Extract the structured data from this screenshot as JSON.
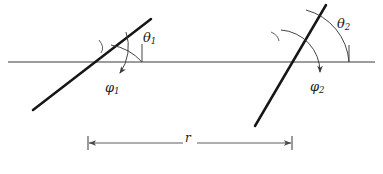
{
  "figure": {
    "background_color": "#ffffff",
    "line_color": "#1a1a1a",
    "baseline_color": "#3a3a3a",
    "arc_color": "#4a4a4a",
    "dimension_color": "#4a4a4a",
    "labels": {
      "theta1": {
        "symbol": "θ",
        "subscript": "1",
        "name": "theta-1"
      },
      "phi1": {
        "symbol": "φ",
        "subscript": "1",
        "name": "phi-1"
      },
      "theta2": {
        "symbol": "θ",
        "subscript": "2",
        "name": "theta-2"
      },
      "phi2": {
        "symbol": "φ",
        "subscript": "2",
        "name": "phi-2"
      },
      "distance": {
        "symbol": "r",
        "subscript": "",
        "name": "distance-r"
      }
    },
    "geometry": {
      "baseline": {
        "x1": 8,
        "y1": 62,
        "x2": 375,
        "y2": 62
      },
      "left_element": {
        "line": {
          "x1": 33,
          "y1": 110,
          "x2": 151,
          "y2": 19
        },
        "intersection": {
          "x": 88,
          "y": 62
        },
        "angle_theta_deg": 37,
        "tick_position": {
          "x": 107,
          "y": 47
        }
      },
      "right_element": {
        "line": {
          "x1": 255,
          "y1": 126,
          "x2": 326,
          "y2": 5
        },
        "intersection": {
          "x": 292,
          "y": 62
        },
        "angle_theta_deg": 60,
        "tick_position": {
          "x": 276,
          "y": 35
        }
      },
      "dimension": {
        "x1": 88,
        "x2": 292,
        "y": 143,
        "tick_half_height": 6
      }
    }
  }
}
